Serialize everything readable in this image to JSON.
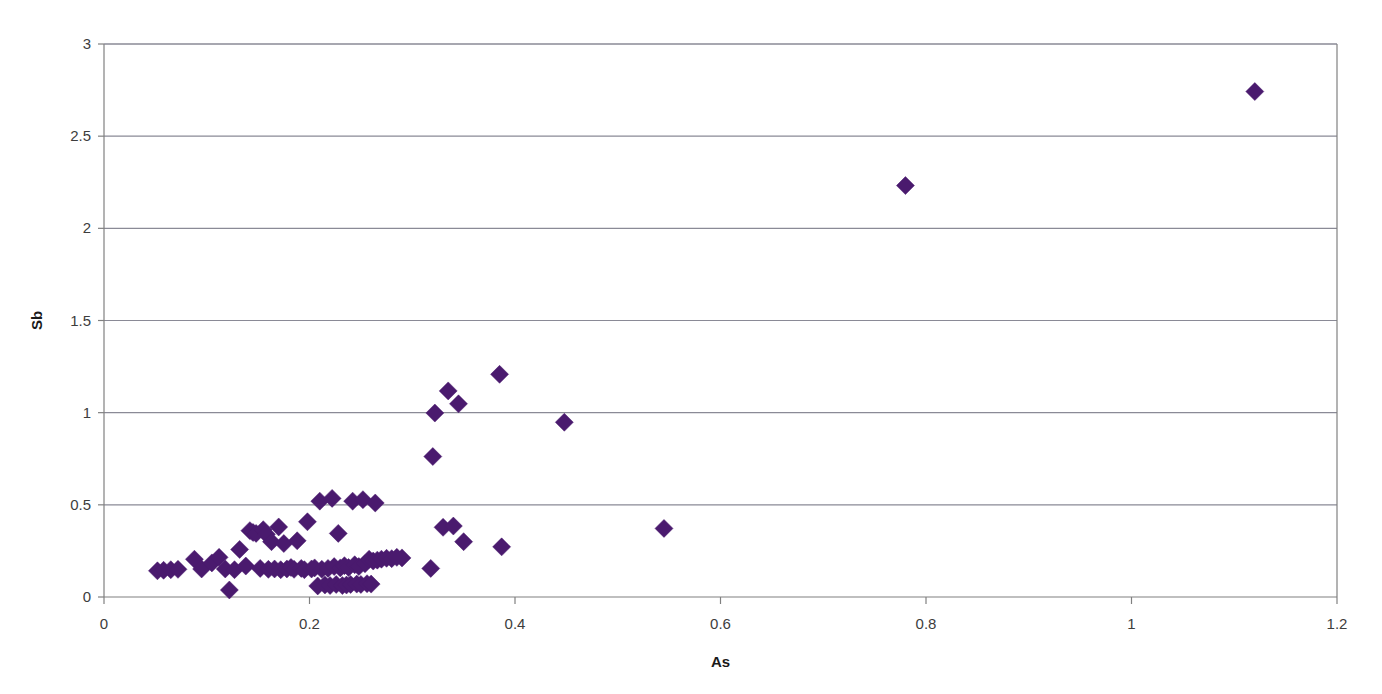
{
  "chart_data": {
    "type": "scatter",
    "title": "",
    "xlabel": "As",
    "ylabel": "Sb",
    "xlim": [
      0,
      1.2
    ],
    "ylim": [
      0,
      3
    ],
    "xticks": [
      0,
      0.2,
      0.4,
      0.6,
      0.8,
      1,
      1.2
    ],
    "xtick_labels": [
      "0",
      "0.2",
      "0.4",
      "0.6",
      "0.8",
      "1",
      "1.2"
    ],
    "yticks": [
      0,
      0.5,
      1,
      1.5,
      2,
      2.5,
      3
    ],
    "ytick_labels": [
      "0",
      "0.5",
      "1",
      "1.5",
      "2",
      "2.5",
      "3"
    ],
    "grid": "horizontal",
    "legend": "none",
    "marker": "diamond",
    "marker_color": "#4a1a6e",
    "marker_size": 9,
    "series": [
      {
        "name": "As vs Sb",
        "points": [
          [
            0.052,
            0.142
          ],
          [
            0.058,
            0.145
          ],
          [
            0.065,
            0.148
          ],
          [
            0.072,
            0.15
          ],
          [
            0.088,
            0.205
          ],
          [
            0.095,
            0.152
          ],
          [
            0.105,
            0.185
          ],
          [
            0.112,
            0.215
          ],
          [
            0.118,
            0.152
          ],
          [
            0.122,
            0.038
          ],
          [
            0.127,
            0.148
          ],
          [
            0.132,
            0.258
          ],
          [
            0.138,
            0.168
          ],
          [
            0.142,
            0.36
          ],
          [
            0.145,
            0.35
          ],
          [
            0.148,
            0.345
          ],
          [
            0.152,
            0.155
          ],
          [
            0.155,
            0.365
          ],
          [
            0.158,
            0.34
          ],
          [
            0.16,
            0.15
          ],
          [
            0.163,
            0.3
          ],
          [
            0.166,
            0.152
          ],
          [
            0.17,
            0.38
          ],
          [
            0.172,
            0.148
          ],
          [
            0.175,
            0.29
          ],
          [
            0.178,
            0.152
          ],
          [
            0.182,
            0.16
          ],
          [
            0.185,
            0.15
          ],
          [
            0.188,
            0.305
          ],
          [
            0.192,
            0.155
          ],
          [
            0.195,
            0.148
          ],
          [
            0.198,
            0.408
          ],
          [
            0.202,
            0.152
          ],
          [
            0.205,
            0.158
          ],
          [
            0.208,
            0.06
          ],
          [
            0.21,
            0.52
          ],
          [
            0.212,
            0.15
          ],
          [
            0.215,
            0.065
          ],
          [
            0.218,
            0.155
          ],
          [
            0.22,
            0.062
          ],
          [
            0.222,
            0.535
          ],
          [
            0.224,
            0.165
          ],
          [
            0.226,
            0.068
          ],
          [
            0.228,
            0.345
          ],
          [
            0.23,
            0.158
          ],
          [
            0.232,
            0.062
          ],
          [
            0.234,
            0.17
          ],
          [
            0.236,
            0.065
          ],
          [
            0.238,
            0.16
          ],
          [
            0.24,
            0.068
          ],
          [
            0.242,
            0.52
          ],
          [
            0.244,
            0.175
          ],
          [
            0.246,
            0.07
          ],
          [
            0.248,
            0.165
          ],
          [
            0.25,
            0.068
          ],
          [
            0.252,
            0.528
          ],
          [
            0.254,
            0.18
          ],
          [
            0.256,
            0.072
          ],
          [
            0.258,
            0.205
          ],
          [
            0.26,
            0.07
          ],
          [
            0.262,
            0.195
          ],
          [
            0.264,
            0.51
          ],
          [
            0.266,
            0.2
          ],
          [
            0.27,
            0.205
          ],
          [
            0.275,
            0.21
          ],
          [
            0.28,
            0.208
          ],
          [
            0.285,
            0.215
          ],
          [
            0.29,
            0.212
          ],
          [
            0.318,
            0.155
          ],
          [
            0.32,
            0.762
          ],
          [
            0.322,
            0.998
          ],
          [
            0.33,
            0.378
          ],
          [
            0.335,
            1.118
          ],
          [
            0.34,
            0.385
          ],
          [
            0.345,
            1.048
          ],
          [
            0.35,
            0.3
          ],
          [
            0.385,
            1.208
          ],
          [
            0.387,
            0.272
          ],
          [
            0.448,
            0.948
          ],
          [
            0.545,
            0.372
          ],
          [
            0.78,
            2.232
          ],
          [
            1.12,
            2.742
          ]
        ]
      }
    ]
  },
  "layout": {
    "plot_left": 104,
    "plot_right": 1337,
    "plot_top": 44,
    "plot_bottom": 597
  }
}
